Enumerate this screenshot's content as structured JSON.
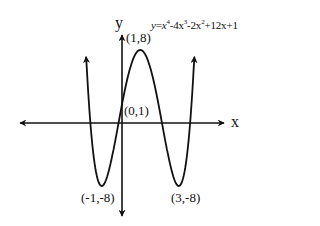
{
  "chart_data": {
    "type": "line",
    "equation": {
      "lhs": "y",
      "terms": [
        "x",
        "4",
        "-4x",
        "3",
        "-2x",
        "2",
        "+12x+1"
      ]
    },
    "xlabel": "x",
    "ylabel": "y",
    "grid": false,
    "legend": "none",
    "x": [
      -1.8,
      -1.5,
      -1,
      -0.5,
      0,
      0.5,
      1,
      1.5,
      2,
      2.5,
      3,
      3.5,
      3.8
    ],
    "values": [
      9.7,
      -1.7,
      -8,
      -4.9,
      1,
      6.1,
      8,
      6.1,
      1,
      -4.9,
      -8,
      -1.7,
      9.7
    ],
    "key_points": [
      {
        "label": "(1,8)",
        "x": 1,
        "y": 8,
        "type": "local maximum"
      },
      {
        "label": "(0,1)",
        "x": 0,
        "y": 1,
        "type": "y-intercept"
      },
      {
        "label": "(-1,-8)",
        "x": -1,
        "y": -8,
        "type": "local minimum"
      },
      {
        "label": "(3,-8)",
        "x": 3,
        "y": -8,
        "type": "local minimum"
      }
    ],
    "colors": {
      "curve": "#111111",
      "axes": "#111111",
      "background": "#ffffff"
    }
  },
  "labels": {
    "x_axis": "x",
    "y_axis": "y",
    "max_point": "(1,8)",
    "intercept_point": "(0,1)",
    "min_left": "(-1,-8)",
    "min_right": "(3,-8)"
  }
}
